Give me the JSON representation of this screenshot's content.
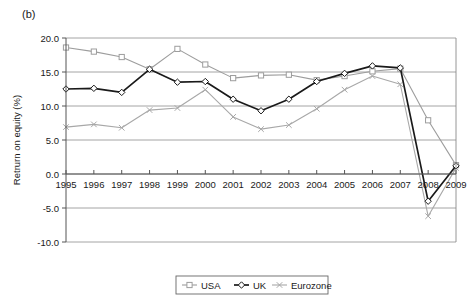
{
  "figure": {
    "panel_label": "(b)"
  },
  "chart_data": {
    "type": "line",
    "title": "",
    "xlabel": "",
    "ylabel": "Retrurn on equity (%)",
    "x": [
      1995,
      1996,
      1997,
      1998,
      1999,
      2000,
      2001,
      2002,
      2003,
      2004,
      2005,
      2006,
      2007,
      2008,
      2009
    ],
    "xtick_labels": [
      "1995",
      "1996",
      "1997",
      "1998",
      "1999",
      "2000",
      "2001",
      "2002",
      "2003",
      "2004",
      "2005",
      "2006",
      "2007",
      "2008",
      "2009"
    ],
    "ytick_labels": [
      "20.0",
      "15.0",
      "10.0",
      "5.0",
      "0.0",
      "-5.0",
      "-10.0"
    ],
    "ytick_values": [
      20,
      15,
      10,
      5,
      0,
      -5,
      -10
    ],
    "ylim": [
      -10,
      20
    ],
    "xlim": [
      1995,
      2009
    ],
    "grid": true,
    "legend_position": "bottom-center",
    "series": [
      {
        "name": "USA",
        "color": "#9d9d9d",
        "marker": "square",
        "values": [
          18.6,
          18.0,
          17.2,
          15.4,
          18.4,
          16.1,
          14.1,
          14.5,
          14.6,
          13.8,
          14.4,
          15.1,
          15.5,
          7.9,
          1.3
        ]
      },
      {
        "name": "UK",
        "color": "#1a1a1a",
        "marker": "diamond",
        "values": [
          12.5,
          12.6,
          12.0,
          15.4,
          13.5,
          13.6,
          11.0,
          9.3,
          11.0,
          13.6,
          14.8,
          15.9,
          15.6,
          -4.0,
          1.2
        ]
      },
      {
        "name": "Eurozone",
        "color": "#a8a8a8",
        "marker": "cross",
        "values": [
          6.9,
          7.3,
          6.8,
          9.4,
          9.7,
          12.4,
          8.4,
          6.6,
          7.2,
          9.6,
          12.4,
          14.4,
          13.2,
          -6.2,
          0.9
        ]
      }
    ]
  },
  "legend": {
    "items": [
      {
        "label": "USA"
      },
      {
        "label": "UK"
      },
      {
        "label": "Eurozone"
      }
    ]
  }
}
